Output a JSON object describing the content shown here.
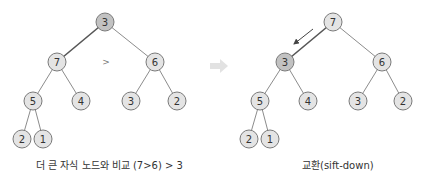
{
  "colors": {
    "node_fill": "#e4e4e4",
    "node_highlight_fill": "#c2c2c2",
    "node_stroke": "#7a7a7a",
    "edge": "#8c8c8c",
    "transition_arrow": "#e0e0e0"
  },
  "left_panel": {
    "caption": "더 큰 자식 노드와 비교 (7>6) > 3",
    "comparison_symbol": ">",
    "nodes": [
      {
        "id": "L0",
        "value": "3",
        "x": 105,
        "y": 22,
        "highlight": true
      },
      {
        "id": "L1",
        "value": "7",
        "x": 57,
        "y": 62,
        "highlight": false
      },
      {
        "id": "L2",
        "value": "6",
        "x": 155,
        "y": 62,
        "highlight": false
      },
      {
        "id": "L3",
        "value": "5",
        "x": 33,
        "y": 101,
        "highlight": false
      },
      {
        "id": "L4",
        "value": "4",
        "x": 81,
        "y": 101,
        "highlight": false
      },
      {
        "id": "L5",
        "value": "3",
        "x": 131,
        "y": 101,
        "highlight": false
      },
      {
        "id": "L6",
        "value": "2",
        "x": 177,
        "y": 101,
        "highlight": false
      },
      {
        "id": "L7",
        "value": "2",
        "x": 22,
        "y": 139,
        "highlight": false
      },
      {
        "id": "L8",
        "value": "1",
        "x": 43,
        "y": 139,
        "highlight": false
      }
    ]
  },
  "right_panel": {
    "caption": "교환(sift-down)",
    "nodes": [
      {
        "id": "R0",
        "value": "7",
        "x": 333,
        "y": 22,
        "highlight": false
      },
      {
        "id": "R1",
        "value": "3",
        "x": 285,
        "y": 62,
        "highlight": true
      },
      {
        "id": "R2",
        "value": "6",
        "x": 382,
        "y": 62,
        "highlight": false
      },
      {
        "id": "R3",
        "value": "5",
        "x": 260,
        "y": 101,
        "highlight": false
      },
      {
        "id": "R4",
        "value": "4",
        "x": 308,
        "y": 101,
        "highlight": false
      },
      {
        "id": "R5",
        "value": "3",
        "x": 358,
        "y": 101,
        "highlight": false
      },
      {
        "id": "R6",
        "value": "2",
        "x": 403,
        "y": 101,
        "highlight": false
      },
      {
        "id": "R7",
        "value": "2",
        "x": 249,
        "y": 139,
        "highlight": false
      },
      {
        "id": "R8",
        "value": "1",
        "x": 270,
        "y": 139,
        "highlight": false
      }
    ]
  }
}
